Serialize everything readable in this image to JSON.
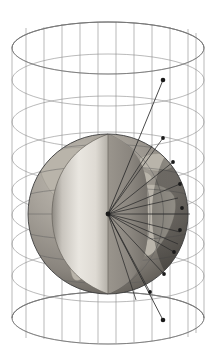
{
  "figure": {
    "title": "Mercator cylindrical projection",
    "caption": "",
    "background_color": "#ffffff",
    "width": 217,
    "height": 346
  },
  "colors": {
    "background": "#ffffff",
    "cylinder_wireframe": "#8c8c8c",
    "cylinder_rim": "#6e6e6e",
    "ray": "#2b2b2b",
    "node_marker": "#1a1a1a",
    "globe_ocean": "#8f8a83",
    "globe_land": "#b9b4aa",
    "globe_outline": "#3c3c3c",
    "graticule": "#5d5d5d",
    "cutaway_interior_light": "#e6e3dd",
    "cutaway_interior_dark": "#9b978f",
    "globe_shadow": "#5a5650"
  },
  "cylinder": {
    "name": "projection-cylinder",
    "axis_x": 108,
    "top_center_y": 48,
    "bottom_center_y": 318,
    "radius_x": 96,
    "radius_y": 26,
    "meridian_count": 13,
    "latitude_ring_count": 9,
    "latitude_ring_center_y": [
      48,
      80,
      122,
      158,
      190,
      215,
      244,
      276,
      318
    ],
    "meridian_label": "meridian-line",
    "ring_label": "latitude-ring"
  },
  "globe": {
    "name": "earth-globe",
    "center_x": 108,
    "center_y": 214,
    "radius": 80,
    "visible_features": [
      "North America",
      "South America",
      "Africa",
      "Europe",
      "Atlantic Ocean"
    ],
    "graticule_parallels": 7,
    "graticule_meridians": 7,
    "cutaway": {
      "name": "cutaway-wedge",
      "description": "lens-shaped sector removed revealing interior",
      "top_x": 108,
      "top_y": 134,
      "bottom_x": 108,
      "bottom_y": 294,
      "left_bulge_x": 52,
      "right_bulge_x": 148
    }
  },
  "rays": {
    "name": "projection-rays",
    "origin_x": 108,
    "origin_y": 214,
    "count": 14,
    "description": "rays from globe centre through surface points onto cylinder",
    "surface_nodes": [
      {
        "x": 163,
        "y": 138
      },
      {
        "x": 173,
        "y": 162
      },
      {
        "x": 180,
        "y": 184
      },
      {
        "x": 182,
        "y": 208
      },
      {
        "x": 180,
        "y": 230
      },
      {
        "x": 174,
        "y": 252
      },
      {
        "x": 164,
        "y": 274
      },
      {
        "x": 150,
        "y": 292
      }
    ],
    "cylinder_nodes": [
      {
        "x": 163,
        "y": 80,
        "label": "upper-projection-point"
      },
      {
        "x": 163,
        "y": 320,
        "label": "lower-projection-point"
      }
    ],
    "equator_ray": {
      "from_x": 108,
      "from_y": 214,
      "to_x": 190,
      "to_y": 214
    }
  },
  "legend": {
    "items": []
  }
}
